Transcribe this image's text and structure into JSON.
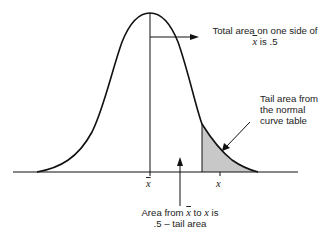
{
  "diagram": {
    "type": "normal-distribution",
    "colors": {
      "curve": "#111111",
      "shade": "#c8c8c8",
      "background": "#ffffff"
    },
    "axis_labels": {
      "mean": "x",
      "x_value": "x"
    },
    "annotations": {
      "top": {
        "line1_pre": "Total area on one side of",
        "line2_var": "x",
        "line2_post": " is .5"
      },
      "tail": {
        "line1": "Tail area from",
        "line2": "the normal",
        "line3": "curve table"
      },
      "bottom": {
        "line1_pre": "Area from ",
        "line1_var1": "x",
        "line1_mid": " to ",
        "line1_var2": "x",
        "line1_post": " is",
        "line2": ".5 – tail area"
      }
    }
  }
}
